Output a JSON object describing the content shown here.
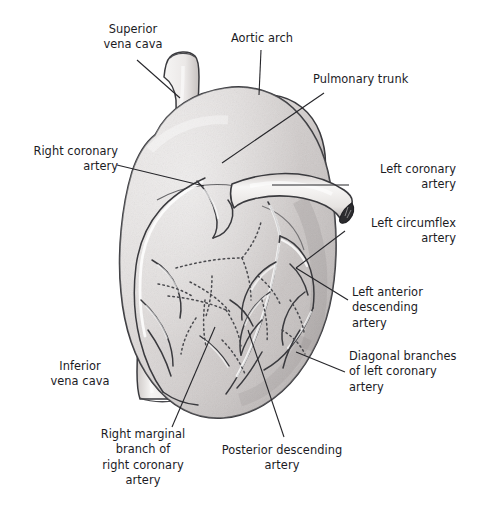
{
  "figure": {
    "background_color": "#ffffff",
    "text_color": "#1b1b1f",
    "muscle_fill": "#dedada",
    "vessel_fill": "#f2f0ef",
    "outline_color": "#3a3a3e",
    "lumen_color": "#2b2b2e"
  },
  "labels": [
    {
      "id": "superior-vena-cava",
      "text": "Superior\nvena cava"
    },
    {
      "id": "aortic-arch",
      "text": "Aortic arch"
    },
    {
      "id": "pulmonary-trunk",
      "text": "Pulmonary trunk"
    },
    {
      "id": "right-coronary-artery",
      "text": "Right coronary\nartery"
    },
    {
      "id": "left-coronary-artery",
      "text": "Left coronary\nartery"
    },
    {
      "id": "left-circumflex-artery",
      "text": "Left circumflex\nartery"
    },
    {
      "id": "left-anterior-descending",
      "text": "Left anterior\ndescending\nartery"
    },
    {
      "id": "diagonal-branches",
      "text": "Diagonal branches\nof left coronary\nartery"
    },
    {
      "id": "inferior-vena-cava",
      "text": "Inferior\nvena cava"
    },
    {
      "id": "right-marginal-branch",
      "text": "Right marginal\nbranch of\nright coronary\nartery"
    },
    {
      "id": "posterior-descending",
      "text": "Posterior descending\nartery"
    }
  ],
  "structures": [
    {
      "id": "superior-vena-cava-vessel",
      "name": "superior vena cava"
    },
    {
      "id": "inferior-vena-cava-vessel",
      "name": "inferior vena cava"
    },
    {
      "id": "aortic-arch-vessel",
      "name": "aortic arch"
    },
    {
      "id": "pulmonary-trunk-vessel",
      "name": "pulmonary trunk"
    },
    {
      "id": "heart-muscle-body",
      "name": "ventricular mass"
    },
    {
      "id": "coronary-vessel-network",
      "name": "coronary arteries"
    }
  ]
}
